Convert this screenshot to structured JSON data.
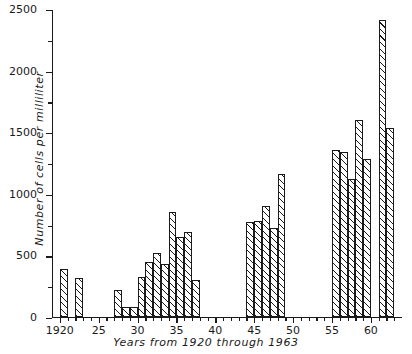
{
  "chart_data": {
    "type": "bar",
    "title": "",
    "subtitle": "",
    "xlabel": "Years from 1920 through 1963",
    "ylabel": "Number of cells per milliliter",
    "xlim": [
      1919,
      1964
    ],
    "ylim": [
      0,
      2500
    ],
    "grid": false,
    "legend": null,
    "y_ticks": [
      0,
      500,
      1000,
      1500,
      2000,
      2500
    ],
    "y_tick_labels": [
      "0",
      "500",
      "1000",
      "1500",
      "2000",
      "2500"
    ],
    "y_minor_ticks": [
      250,
      750,
      1250,
      1750,
      2250
    ],
    "x_ticks": [
      1920,
      1925,
      1930,
      1935,
      1940,
      1945,
      1950,
      1955,
      1960
    ],
    "x_tick_labels": [
      "1920",
      "25",
      "30",
      "35",
      "40",
      "45",
      "50",
      "55",
      "60"
    ],
    "x_minor_ticks": [
      1921,
      1922,
      1923,
      1924,
      1926,
      1927,
      1928,
      1929,
      1931,
      1932,
      1933,
      1934,
      1936,
      1937,
      1938,
      1939,
      1941,
      1942,
      1943,
      1944,
      1946,
      1947,
      1948,
      1949,
      1951,
      1952,
      1953,
      1954,
      1956,
      1957,
      1958,
      1959,
      1961,
      1962,
      1963
    ],
    "bar_width_years": 1,
    "bar_style": "diagonal-hatch",
    "categories": [
      1920,
      1922,
      1927,
      1928,
      1929,
      1930,
      1931,
      1932,
      1933,
      1934,
      1935,
      1936,
      1937,
      1944,
      1945,
      1946,
      1947,
      1948,
      1955,
      1956,
      1957,
      1958,
      1959,
      1961,
      1962
    ],
    "values": [
      390,
      310,
      220,
      80,
      80,
      320,
      440,
      520,
      430,
      850,
      650,
      690,
      300,
      770,
      780,
      900,
      720,
      1160,
      1350,
      1340,
      1120,
      1600,
      1280,
      2410,
      1530
    ],
    "missing_years": [
      1921,
      1923,
      1924,
      1925,
      1926,
      1938,
      1939,
      1940,
      1941,
      1942,
      1943,
      1949,
      1950,
      1951,
      1952,
      1953,
      1954,
      1960,
      1963
    ]
  }
}
